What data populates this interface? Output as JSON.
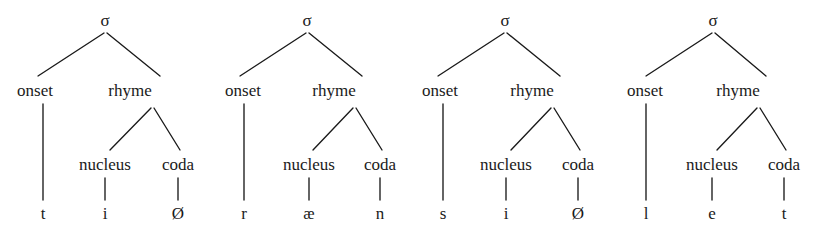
{
  "diagram": {
    "type": "linguistic-tree",
    "background_color": "#ffffff",
    "text_color": "#1a1a1a",
    "line_color": "#1a1a1a",
    "node_labels": {
      "syllable": "σ",
      "onset": "onset",
      "rhyme": "rhyme",
      "nucleus": "nucleus",
      "coda": "coda"
    },
    "trees": [
      {
        "id": "tree-1",
        "word": "tiØ",
        "sigma": "σ",
        "onset_label": "onset",
        "rhyme_label": "rhyme",
        "nucleus_label": "nucleus",
        "coda_label": "coda",
        "onset_segment": "t",
        "nucleus_segment": "i",
        "coda_segment": "Ø",
        "layout": {
          "sigma_x": 105,
          "onset_x": 35,
          "rhyme_x": 130,
          "nucleus_x": 105,
          "coda_x": 178,
          "onset_term_x": 43,
          "nucleus_term_x": 105,
          "coda_term_x": 178
        }
      },
      {
        "id": "tree-2",
        "word": "ræn",
        "sigma": "σ",
        "onset_label": "onset",
        "rhyme_label": "rhyme",
        "nucleus_label": "nucleus",
        "coda_label": "coda",
        "onset_segment": "r",
        "nucleus_segment": "æ",
        "coda_segment": "n",
        "layout": {
          "sigma_x": 307,
          "onset_x": 243,
          "rhyme_x": 334,
          "nucleus_x": 309,
          "coda_x": 380,
          "onset_term_x": 244,
          "nucleus_term_x": 309,
          "coda_term_x": 380
        }
      },
      {
        "id": "tree-3",
        "word": "siØ",
        "sigma": "σ",
        "onset_label": "onset",
        "rhyme_label": "rhyme",
        "nucleus_label": "nucleus",
        "coda_label": "coda",
        "onset_segment": "s",
        "nucleus_segment": "i",
        "coda_segment": "Ø",
        "layout": {
          "sigma_x": 505,
          "onset_x": 440,
          "rhyme_x": 532,
          "nucleus_x": 506,
          "coda_x": 578,
          "onset_term_x": 443,
          "nucleus_term_x": 506,
          "coda_term_x": 578
        }
      },
      {
        "id": "tree-4",
        "word": "let",
        "sigma": "σ",
        "onset_label": "onset",
        "rhyme_label": "rhyme",
        "nucleus_label": "nucleus",
        "coda_label": "coda",
        "onset_segment": "l",
        "nucleus_segment": "e",
        "coda_segment": "t",
        "layout": {
          "sigma_x": 713,
          "onset_x": 645,
          "rhyme_x": 738,
          "nucleus_x": 712,
          "coda_x": 784,
          "onset_term_x": 646,
          "nucleus_term_x": 712,
          "coda_term_x": 784
        }
      }
    ],
    "rows": {
      "sigma_baseline_y": 26,
      "level1_baseline_y": 96,
      "level2_baseline_y": 170,
      "terminal_baseline_y": 219
    }
  }
}
